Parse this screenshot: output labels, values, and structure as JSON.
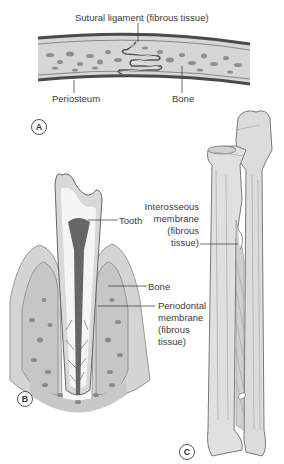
{
  "figure": {
    "panels": [
      {
        "id": "A",
        "badge": "A",
        "subject": "suture",
        "labels": {
          "sutural_ligament": "Sutural ligament (fibrous tissue)",
          "periosteum": "Periosteum",
          "bone": "Bone"
        }
      },
      {
        "id": "B",
        "badge": "B",
        "subject": "tooth socket (gomphosis)",
        "labels": {
          "tooth": "Tooth",
          "bone": "Bone",
          "periodontal_line1": "Periodontal",
          "periodontal_line2": "membrane",
          "periodontal_line3": "(fibrous",
          "periodontal_line4": "tissue)"
        }
      },
      {
        "id": "C",
        "badge": "C",
        "subject": "radius and ulna (syndesmosis)",
        "labels": {
          "interosseous_line1": "Interosseous",
          "interosseous_line2": "membrane",
          "interosseous_line3": "(fibrous",
          "interosseous_line4": "tissue)"
        }
      }
    ],
    "colors": {
      "bone_fill": "#d9d9d9",
      "bone_dark": "#8a8a8a",
      "cortex": "#555555",
      "tooth_fill": "#f2f2f2",
      "pulp": "#666666",
      "label": "#3a3a3a"
    }
  }
}
